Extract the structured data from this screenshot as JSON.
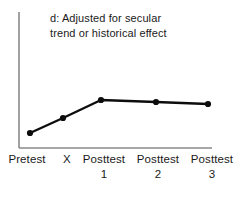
{
  "figure": {
    "panel_label": "d",
    "title_lines": [
      "d: Adjusted for secular",
      "trend or historical effect"
    ]
  },
  "colors": {
    "line": "#0d0d0d",
    "marker": "#0d0d0d",
    "axis": "#8a8a8a",
    "text": "#1a1a1a",
    "background": "#ffffff"
  },
  "chart_data": {
    "type": "line",
    "title": "d: Adjusted for secular trend or historical effect",
    "xlabel": "",
    "ylabel": "",
    "grid": false,
    "legend": "none",
    "categories": [
      "Pretest",
      "X",
      "Posttest 1",
      "Posttest 2",
      "Posttest 3"
    ],
    "category_labels": [
      {
        "main": "Pretest",
        "sub": ""
      },
      {
        "main": "X",
        "sub": ""
      },
      {
        "main": "Posttest",
        "sub": "1"
      },
      {
        "main": "Posttest",
        "sub": "2"
      },
      {
        "main": "Posttest",
        "sub": "3"
      }
    ],
    "series": [
      {
        "name": "outcome",
        "values": [
          0.3,
          0.62,
          1.0,
          0.96,
          0.92
        ]
      }
    ],
    "ylim": [
      0,
      1.3
    ],
    "pixel_points": [
      {
        "x": 30,
        "y": 133
      },
      {
        "x": 63,
        "y": 118
      },
      {
        "x": 101,
        "y": 100
      },
      {
        "x": 156,
        "y": 102
      },
      {
        "x": 208,
        "y": 104
      }
    ],
    "axes": {
      "x_axis": {
        "x1": 19,
        "y1": 148,
        "x2": 212,
        "y2": 148
      },
      "y_axis": {
        "x1": 19,
        "y1": 12,
        "x2": 19,
        "y2": 148
      }
    },
    "marker_radius": 3.1,
    "line_width": 2.4,
    "annotations": []
  }
}
